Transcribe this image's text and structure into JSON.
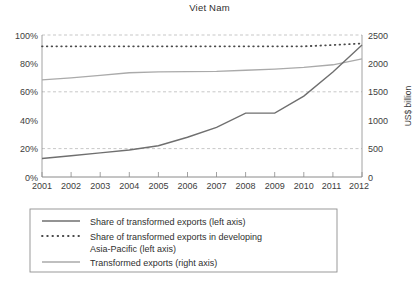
{
  "chart_data": {
    "type": "line",
    "title": "Viet Nam",
    "xlabel": "",
    "ylabel": "",
    "y2label": "US$ billion",
    "grid": true,
    "legend_position": "bottom",
    "x": [
      2001,
      2002,
      2003,
      2004,
      2005,
      2006,
      2007,
      2008,
      2009,
      2010,
      2011,
      2012
    ],
    "categories": [
      "2001",
      "2002",
      "2003",
      "2004",
      "2005",
      "2006",
      "2007",
      "2008",
      "2009",
      "2010",
      "2011",
      "2012"
    ],
    "ylim": [
      0,
      100
    ],
    "yticks": [
      0,
      20,
      40,
      60,
      80,
      100
    ],
    "ytick_labels": [
      "0%",
      "20%",
      "40%",
      "60%",
      "80%",
      "100%"
    ],
    "y2lim": [
      0,
      2500
    ],
    "y2ticks": [
      0,
      500,
      1000,
      1500,
      2000,
      2500
    ],
    "y2tick_labels": [
      "0",
      "500",
      "1000",
      "1500",
      "2000",
      "2500"
    ],
    "series": [
      {
        "name": "Share of transformed exports (left axis)",
        "axis": "left",
        "style": "solid",
        "color": "#6f6f6f",
        "units": "%",
        "values": [
          13,
          15,
          17,
          19,
          22,
          28,
          35,
          45,
          45,
          57,
          74,
          93
        ]
      },
      {
        "name": "Share of transformed exports in developing Asia-Pacific (left axis)",
        "axis": "left",
        "style": "dotted",
        "color": "#4a4a4a",
        "units": "%",
        "values": [
          92,
          92,
          92,
          92,
          92,
          92,
          92,
          92,
          92,
          92,
          93,
          94
        ]
      },
      {
        "name": "Transformed exports (right axis)",
        "axis": "right",
        "style": "solid",
        "color": "#aaaaaa",
        "units": "US$ billion",
        "values": [
          1710,
          1745,
          1790,
          1835,
          1850,
          1855,
          1860,
          1880,
          1900,
          1930,
          1975,
          2080
        ]
      }
    ]
  },
  "legend": {
    "items": [
      {
        "label": "Share of transformed exports (left axis)",
        "swatch": "solid-dark"
      },
      {
        "label": "Share of transformed exports in developing",
        "swatch": "dotted"
      },
      {
        "label": "Asia-Pacific (left axis)",
        "swatch": "none"
      },
      {
        "label": "Transformed exports (right axis)",
        "swatch": "solid-light"
      }
    ]
  },
  "colors": {
    "background": "#ffffff",
    "axis": "#8a8a8a",
    "grid": "#b9b9b9",
    "series_share": "#6f6f6f",
    "series_asiapacific": "#4a4a4a",
    "series_exports": "#aaaaaa",
    "legend_border": "#8f8f8f"
  }
}
